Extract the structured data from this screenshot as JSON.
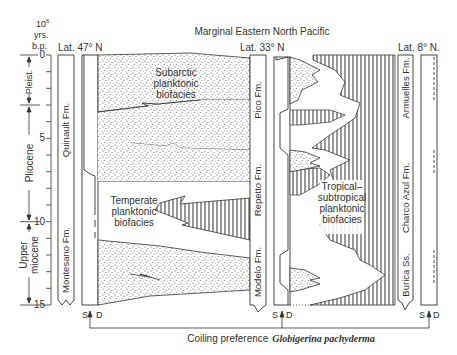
{
  "figure": {
    "title": "Marginal Eastern North Pacific",
    "y_axis": {
      "unit_line1": "10",
      "unit_exp": "6",
      "unit_line2": "yrs.",
      "unit_line3": "b.p.",
      "ticks": [
        "0",
        "5",
        "10",
        "15"
      ],
      "range": [
        0,
        15
      ]
    },
    "epochs": [
      {
        "label": "Pleist.",
        "from": 0,
        "to": 3
      },
      {
        "label": "Pliocene",
        "from": 3,
        "to": 10
      },
      {
        "label_line1": "Upper",
        "label_line2": "miocene",
        "from": 10,
        "to": 15
      }
    ],
    "sites": [
      {
        "latitude": "Lat. 47° N",
        "formations": [
          {
            "label": "Quinault Fm.",
            "from": 0,
            "to": 10.5
          },
          {
            "label": "Montesano Fm.",
            "from": 10.5,
            "to": 15
          }
        ]
      },
      {
        "latitude": "Lat. 33° N",
        "formations": [
          {
            "label": "Pico Fm.",
            "from": 2,
            "to": 7
          },
          {
            "label": "Repetto Fm.",
            "from": 7,
            "to": 12
          },
          {
            "label": "Modelo Fm.",
            "from": 12,
            "to": 15
          }
        ]
      },
      {
        "latitude": "Lat. 8° N.",
        "formations": [
          {
            "label": "Armuelles Fm.",
            "from": 0,
            "to": 5.5
          },
          {
            "label": "Charco Azul Fm.",
            "from": 5.5,
            "to": 12.5
          },
          {
            "label": "Burica Ss.",
            "from": 12.5,
            "to": 15
          }
        ]
      }
    ],
    "biofacies": [
      {
        "line1": "Subarctic",
        "line2": "planktonic",
        "line3": "biofacies"
      },
      {
        "line1": "Temperate",
        "line2": "planktonic",
        "line3": "biofacies"
      },
      {
        "line1": "Tropical–",
        "line2": "subtropical",
        "line3": "planktonic",
        "line4": "biofacies"
      }
    ],
    "coiling": {
      "sinistral": "S",
      "dextral": "D",
      "caption_prefix": "Coiling preference",
      "species": "Globigerina pachyderma"
    }
  }
}
